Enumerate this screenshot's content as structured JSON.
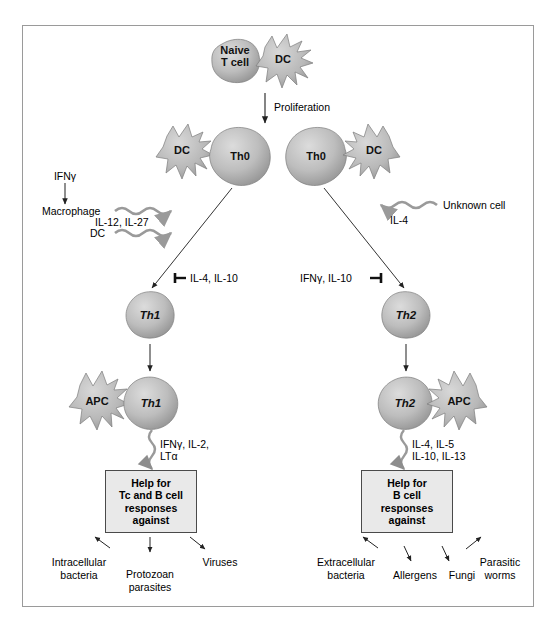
{
  "figure": {
    "frame_color": "#9a9a9a",
    "cell_fill": "#b6b6b6",
    "box_fill": "#e9e9e9"
  },
  "top": {
    "naive_t_cell": "Naive\nT cell",
    "naive_t_cell_line1": "Naive",
    "naive_t_cell_line2": "T cell",
    "dc": "DC",
    "proliferation": "Proliferation"
  },
  "th0": {
    "left_dc": "DC",
    "left_th0": "Th0",
    "right_th0": "Th0",
    "right_dc": "DC"
  },
  "left_inducers": {
    "ifng": "IFNγ",
    "macrophage": "Macrophage",
    "dc": "DC",
    "cytokines": "IL-12, IL-27"
  },
  "right_inducers": {
    "unknown_cell": "Unknown cell",
    "cytokine": "IL-4"
  },
  "inhibitors": {
    "left": "IL-4, IL-10",
    "right": "IFNγ, IL-10"
  },
  "subsets": {
    "th1": "Th1",
    "th2": "Th2"
  },
  "effector": {
    "left_apc": "APC",
    "left_th1": "Th1",
    "right_th2": "Th2",
    "right_apc": "APC",
    "left_cytokines_line1": "IFNγ, IL-2,",
    "left_cytokines_line2": "LTα",
    "right_cytokines_line1": "IL-4, IL-5",
    "right_cytokines_line2": "IL-10, IL-13"
  },
  "help_boxes": {
    "left_line1": "Help for",
    "left_line2": "Tc and B cell",
    "left_line3": "responses",
    "left_line4": "against",
    "right_line1": "Help for",
    "right_line2": "B cell",
    "right_line3": "responses",
    "right_line4": "against"
  },
  "outcomes": {
    "left": [
      {
        "line1": "Intracellular",
        "line2": "bacteria"
      },
      {
        "line1": "Protozoan",
        "line2": "parasites"
      },
      {
        "line1": "Viruses",
        "line2": ""
      }
    ],
    "right": [
      {
        "line1": "Extracellular",
        "line2": "bacteria"
      },
      {
        "line1": "Allergens",
        "line2": ""
      },
      {
        "line1": "Fungi",
        "line2": ""
      },
      {
        "line1": "Parasitic",
        "line2": "worms"
      }
    ]
  }
}
